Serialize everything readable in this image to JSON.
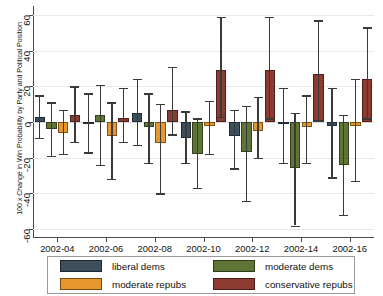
{
  "chart_data": {
    "type": "bar",
    "title": "",
    "subtitle": "",
    "xlabel": "",
    "ylabel": "100 x Change in Win Probability by Party and Political Position",
    "categories": [
      "2002-04",
      "2002-06",
      "2002-08",
      "2002-10",
      "2002-12",
      "2002-14",
      "2002-16"
    ],
    "ylim": [
      -65,
      65
    ],
    "yticks": [
      -60,
      -40,
      -20,
      0,
      20,
      40,
      60
    ],
    "ytick_labels": [
      "-60",
      "-40",
      "-20",
      "0",
      "20",
      "40",
      "60"
    ],
    "grid": true,
    "legend_position": "bottom",
    "error_bars": "confidence-interval",
    "series": [
      {
        "name": "liberal dems",
        "color": "#3D4F5C",
        "values": [
          3,
          0,
          5,
          -9,
          -8,
          -1,
          -2
        ],
        "ci_low": [
          -9,
          -17,
          -13,
          -23,
          -26,
          -23,
          -31
        ],
        "ci_high": [
          15,
          16,
          24,
          6,
          7,
          19,
          19
        ]
      },
      {
        "name": "moderate dems",
        "color": "#5E7535",
        "values": [
          -4,
          4,
          -3,
          -18,
          -17,
          -26,
          -24
        ],
        "ci_low": [
          -19,
          -24,
          -23,
          -37,
          -44,
          -58,
          -52
        ],
        "ci_high": [
          11,
          21,
          16,
          2,
          9,
          5,
          4
        ]
      },
      {
        "name": "moderate repubs",
        "color": "#E8962F",
        "values": [
          -6,
          -8,
          -12,
          -2,
          -5,
          -3,
          -2
        ],
        "ci_low": [
          -18,
          -32,
          -40,
          -18,
          -20,
          -23,
          -33
        ],
        "ci_high": [
          7,
          11,
          10,
          12,
          14,
          15,
          24
        ]
      },
      {
        "name": "conservative repubs",
        "color": "#8D3B30",
        "values": [
          4,
          2,
          7,
          29,
          29,
          27,
          24
        ],
        "ci_low": [
          -11,
          -11,
          -7,
          3,
          2,
          1,
          2
        ],
        "ci_high": [
          20,
          19,
          31,
          59,
          59,
          57,
          53
        ]
      }
    ]
  },
  "legend": {
    "items": [
      {
        "label": "liberal dems",
        "color": "#3D4F5C"
      },
      {
        "label": "moderate dems",
        "color": "#5E7535"
      },
      {
        "label": "moderate repubs",
        "color": "#E8962F"
      },
      {
        "label": "conservative repubs",
        "color": "#8D3B30"
      }
    ]
  }
}
